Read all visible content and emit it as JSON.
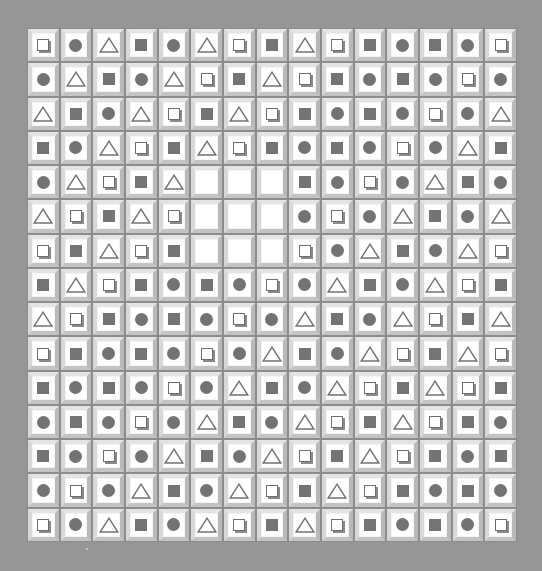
{
  "game": {
    "title": "Shape tile board",
    "rows": 15,
    "cols": 15,
    "legend": {
      "Q": "hollow-square-icon",
      "C": "circle-icon",
      "T": "triangle-icon",
      "S": "filled-square-icon",
      "_": "empty"
    },
    "colors": {
      "background": "#969696",
      "tile_face": "#ffffff",
      "icon": "#737373"
    },
    "grid": [
      [
        "Q",
        "C",
        "T",
        "S",
        "C",
        "T",
        "Q",
        "S",
        "T",
        "Q",
        "S",
        "C",
        "S",
        "C",
        "Q"
      ],
      [
        "C",
        "T",
        "S",
        "C",
        "T",
        "Q",
        "S",
        "T",
        "Q",
        "S",
        "C",
        "S",
        "C",
        "Q",
        "C"
      ],
      [
        "T",
        "S",
        "C",
        "T",
        "Q",
        "S",
        "T",
        "Q",
        "S",
        "C",
        "S",
        "C",
        "Q",
        "C",
        "T"
      ],
      [
        "S",
        "C",
        "T",
        "Q",
        "S",
        "T",
        "Q",
        "S",
        "C",
        "S",
        "C",
        "Q",
        "C",
        "T",
        "S"
      ],
      [
        "C",
        "T",
        "Q",
        "S",
        "T",
        "_",
        "_",
        "_",
        "S",
        "C",
        "Q",
        "C",
        "T",
        "S",
        "C"
      ],
      [
        "T",
        "Q",
        "S",
        "T",
        "Q",
        "_",
        "_",
        "_",
        "C",
        "Q",
        "C",
        "T",
        "S",
        "C",
        "T"
      ],
      [
        "Q",
        "S",
        "T",
        "Q",
        "S",
        "_",
        "_",
        "_",
        "Q",
        "C",
        "T",
        "S",
        "C",
        "T",
        "Q"
      ],
      [
        "S",
        "T",
        "Q",
        "S",
        "C",
        "S",
        "C",
        "Q",
        "C",
        "T",
        "S",
        "C",
        "T",
        "Q",
        "S"
      ],
      [
        "T",
        "Q",
        "S",
        "C",
        "S",
        "C",
        "Q",
        "C",
        "T",
        "S",
        "C",
        "T",
        "Q",
        "S",
        "T"
      ],
      [
        "Q",
        "S",
        "C",
        "S",
        "C",
        "Q",
        "C",
        "T",
        "S",
        "C",
        "T",
        "Q",
        "S",
        "T",
        "Q"
      ],
      [
        "S",
        "C",
        "S",
        "C",
        "Q",
        "C",
        "T",
        "S",
        "C",
        "T",
        "Q",
        "S",
        "T",
        "Q",
        "S"
      ],
      [
        "C",
        "S",
        "C",
        "Q",
        "C",
        "T",
        "S",
        "C",
        "T",
        "Q",
        "S",
        "T",
        "Q",
        "S",
        "C"
      ],
      [
        "S",
        "C",
        "Q",
        "C",
        "T",
        "S",
        "C",
        "T",
        "Q",
        "S",
        "T",
        "Q",
        "S",
        "C",
        "S"
      ],
      [
        "C",
        "Q",
        "C",
        "T",
        "S",
        "C",
        "T",
        "Q",
        "S",
        "T",
        "Q",
        "S",
        "C",
        "S",
        "C"
      ],
      [
        "Q",
        "C",
        "T",
        "S",
        "C",
        "T",
        "Q",
        "S",
        "T",
        "Q",
        "S",
        "C",
        "S",
        "C",
        "Q"
      ]
    ]
  }
}
